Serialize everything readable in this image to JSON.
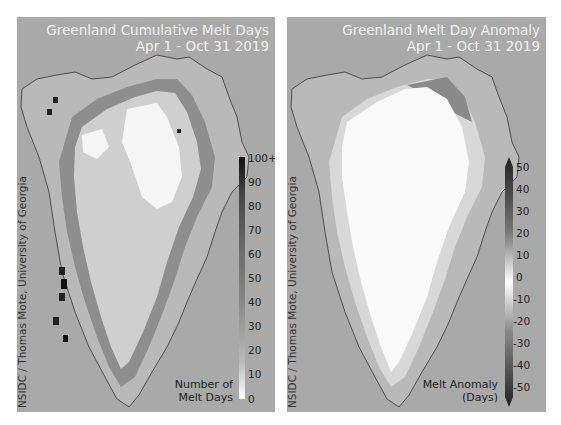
{
  "left_panel": {
    "title_line1": "Greenland Cumulative Melt Days",
    "title_line2": "Apr 1 - Oct 31 2019",
    "credit": "NSIDC / Thomas Mote, University of Georgia",
    "legend_line1": "Number of",
    "legend_line2": "Melt Days",
    "colorbar": {
      "ticks": [
        "100+",
        "90",
        "80",
        "70",
        "60",
        "50",
        "40",
        "30",
        "20",
        "10",
        "0"
      ],
      "min_color": "#ffffff",
      "max_color": "#111111"
    }
  },
  "right_panel": {
    "title_line1": "Greenland Melt Day Anomaly",
    "title_line2": "Apr 1 - Oct 31 2019",
    "credit": "NSIDC / Thomas Mote, University of Georgia",
    "legend_line1": "Melt Anomaly",
    "legend_line2": "(Days)",
    "colorbar": {
      "ticks": [
        "50",
        "40",
        "30",
        "20",
        "10",
        "0",
        "-10",
        "-20",
        "-30",
        "-40",
        "-50"
      ],
      "center_color": "#ffffff",
      "extreme_color": "#222222"
    }
  },
  "colors": {
    "panel_bg": "#a9a9a9",
    "title_text": "#f2f2f2",
    "label_text": "#222222"
  }
}
